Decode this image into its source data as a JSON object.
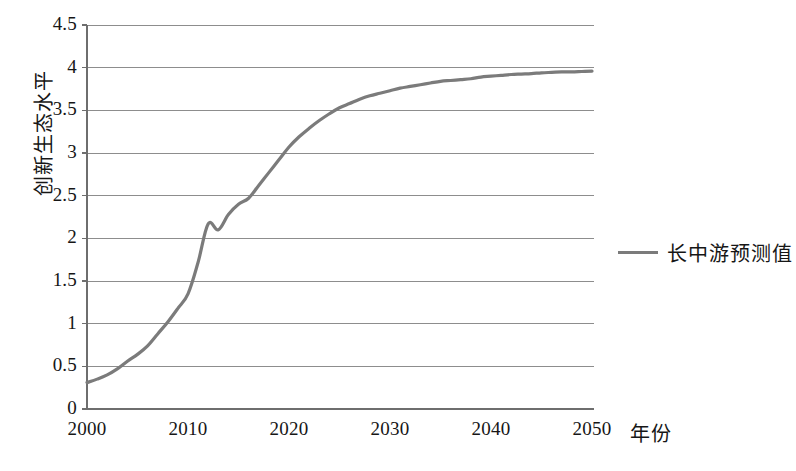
{
  "chart_data": {
    "type": "line",
    "title": "",
    "xlabel": "年份",
    "ylabel": "创新生态水平",
    "xlim": [
      2000,
      2050
    ],
    "ylim": [
      0,
      4.5
    ],
    "grid": true,
    "grid_axis": "y",
    "legend_position": "right",
    "series": [
      {
        "name": "长中游预测值",
        "color": "#7b7b7b",
        "x": [
          2000,
          2001,
          2002,
          2003,
          2004,
          2005,
          2006,
          2007,
          2008,
          2009,
          2010,
          2011,
          2012,
          2013,
          2014,
          2015,
          2016,
          2017,
          2018,
          2019,
          2020,
          2021,
          2022,
          2023,
          2024,
          2025,
          2026,
          2027,
          2028,
          2029,
          2030,
          2031,
          2032,
          2033,
          2034,
          2035,
          2036,
          2037,
          2038,
          2039,
          2040,
          2041,
          2042,
          2043,
          2044,
          2045,
          2046,
          2047,
          2048,
          2049,
          2050
        ],
        "values": [
          0.31,
          0.35,
          0.4,
          0.47,
          0.56,
          0.64,
          0.74,
          0.88,
          1.02,
          1.18,
          1.35,
          1.72,
          2.17,
          2.1,
          2.28,
          2.4,
          2.47,
          2.62,
          2.77,
          2.92,
          3.07,
          3.19,
          3.29,
          3.38,
          3.46,
          3.53,
          3.58,
          3.63,
          3.67,
          3.7,
          3.73,
          3.76,
          3.78,
          3.8,
          3.82,
          3.84,
          3.85,
          3.86,
          3.87,
          3.89,
          3.9,
          3.91,
          3.92,
          3.925,
          3.93,
          3.94,
          3.945,
          3.95,
          3.95,
          3.955,
          3.96
        ]
      }
    ],
    "yticks": [
      "0",
      "0.5",
      "1",
      "1.5",
      "2",
      "2.5",
      "3",
      "3.5",
      "4",
      "4.5"
    ],
    "ytick_values": [
      0,
      0.5,
      1,
      1.5,
      2,
      2.5,
      3,
      3.5,
      4,
      4.5
    ],
    "xticks": [
      "2000",
      "2010",
      "2020",
      "2030",
      "2040",
      "2050"
    ],
    "xtick_values": [
      2000,
      2010,
      2020,
      2030,
      2040,
      2050
    ],
    "colors": {
      "line": "#7b7b7b",
      "grid": "#8d8d8d",
      "axis": "#6e6e6e",
      "text": "#161616",
      "background": "#ffffff"
    }
  },
  "legend": {
    "label": "长中游预测值"
  },
  "axes": {
    "x_title": "年份",
    "y_title": "创新生态水平"
  }
}
